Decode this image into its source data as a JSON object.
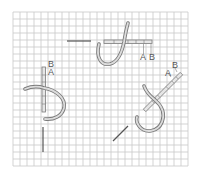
{
  "diagram": {
    "type": "embroidery-stitch-instructions",
    "grid": {
      "x_start": 13,
      "y_start": 12,
      "x_end": 188,
      "y_end": 166,
      "spacing": 7,
      "line_color": "#c8c8c8"
    },
    "colors": {
      "thread_outer": "#7a7a7a",
      "thread_inner": "#d9d9d9",
      "needle": "#555555",
      "label": "#555555",
      "background": "#ffffff"
    },
    "stitches": [
      {
        "id": "top",
        "orientation": "horizontal",
        "labels": [
          {
            "text": "A",
            "x": 140,
            "y": 53
          },
          {
            "text": "B",
            "x": 149,
            "y": 53
          }
        ]
      },
      {
        "id": "left",
        "orientation": "vertical",
        "labels": [
          {
            "text": "B",
            "x": 48,
            "y": 60
          },
          {
            "text": "A",
            "x": 48,
            "y": 68
          }
        ]
      },
      {
        "id": "right",
        "orientation": "diagonal",
        "labels": [
          {
            "text": "A",
            "x": 165,
            "y": 69
          },
          {
            "text": "B",
            "x": 172,
            "y": 61
          }
        ]
      }
    ]
  }
}
